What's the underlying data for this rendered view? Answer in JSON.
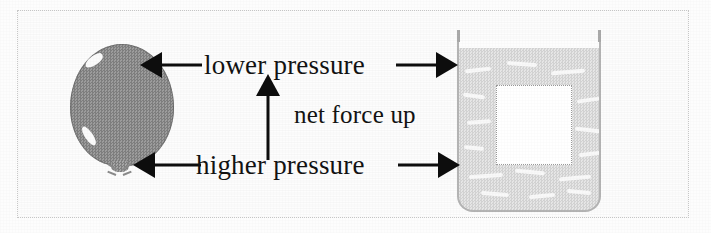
{
  "figure": {
    "background_color": "#fdfdfd",
    "frame_color": "#adadad"
  },
  "labels": {
    "lower_pressure": "lower pressure",
    "higher_pressure": "higher pressure",
    "net_force_up": "net force up"
  },
  "objects": {
    "balloon": {
      "name": "balloon",
      "fill_color": "#8d8d8d",
      "highlight_color": "#fbfbfb"
    },
    "water_container": {
      "name": "water container",
      "water_color": "#dcdcdc",
      "wall_color": "#a9a9a9",
      "void_label": "displaced volume",
      "void_color": "#ffffff"
    }
  },
  "arrows": {
    "top_left": "arrow pointing left to balloon top",
    "top_right": "arrow pointing right to water top",
    "bottom_left": "arrow pointing left to balloon bottom",
    "bottom_right": "arrow pointing right to water bottom",
    "center_up": "arrow pointing up",
    "color": "#0d0d0d"
  }
}
